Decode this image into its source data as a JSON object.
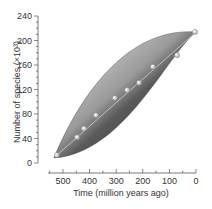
{
  "chart_data": {
    "type": "scatter",
    "title": "",
    "xlabel": "Time (million years ago)",
    "ylabel": "Number of species (×10³)",
    "x_reversed": true,
    "xlim": [
      530,
      0
    ],
    "ylim": [
      0,
      240
    ],
    "x_ticks": [
      500,
      400,
      300,
      200,
      100,
      0
    ],
    "y_ticks": [
      0,
      40,
      80,
      120,
      160,
      200,
      240
    ],
    "grid": false,
    "legend": null,
    "series": [
      {
        "name": "species",
        "x": [
          523,
          447,
          421,
          376,
          305,
          259,
          214,
          162,
          71,
          4
        ],
        "y": [
          13,
          42,
          56,
          78,
          106,
          119,
          131,
          157,
          176,
          214
        ]
      }
    ],
    "annotations": [
      "shaded spindle envelope around trend line"
    ]
  },
  "colors": {
    "axis": "#555555",
    "envelope_dark": "#3a3a3a",
    "envelope_light": "#d8d8d8",
    "point_fill": "#e6e6e6"
  }
}
